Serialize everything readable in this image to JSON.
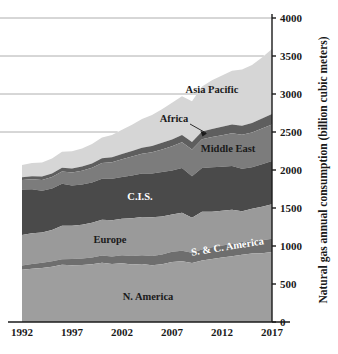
{
  "chart_data": {
    "type": "area",
    "title": "",
    "subtitle": "",
    "xlabel": "",
    "ylabel": "Natural gas annual consumption (billion cubic meters)",
    "xlim": [
      1992,
      2017
    ],
    "ylim": [
      0,
      4000
    ],
    "grid": true,
    "grid_values": [
      2500,
      3000,
      3500,
      4000
    ],
    "legend_position": "inline-labels",
    "y_axis_side": "right",
    "xticks": [
      "1992",
      "1997",
      "2002",
      "2007",
      "2012",
      "2017"
    ],
    "xtick_values": [
      1992,
      1997,
      2002,
      2007,
      2012,
      2017
    ],
    "yticks": [
      "0",
      "500",
      "1000",
      "1500",
      "2000",
      "2500",
      "3000",
      "3500",
      "4000"
    ],
    "ytick_values": [
      0,
      500,
      1000,
      1500,
      2000,
      2500,
      3000,
      3500,
      4000
    ],
    "x": [
      1992,
      1993,
      1994,
      1995,
      1996,
      1997,
      1998,
      1999,
      2000,
      2001,
      2002,
      2003,
      2004,
      2005,
      2006,
      2007,
      2008,
      2009,
      2010,
      2011,
      2012,
      2013,
      2014,
      2015,
      2016,
      2017
    ],
    "stack_order_bottom_to_top": [
      "N. America",
      "S. & C. America",
      "Europe",
      "C.I.S.",
      "Middle East",
      "Africa",
      "Asia Pacific"
    ],
    "series": [
      {
        "name": "N. America",
        "color": "#9e9e9e",
        "label_color": "#1a1a1a",
        "values": [
          687,
          700,
          712,
          728,
          752,
          748,
          750,
          760,
          780,
          762,
          772,
          758,
          762,
          748,
          760,
          790,
          800,
          775,
          810,
          830,
          850,
          865,
          885,
          900,
          905,
          920
        ]
      },
      {
        "name": "S. & C. America",
        "color": "#6e6e6e",
        "label_color": "#ffffff",
        "values": [
          58,
          62,
          66,
          70,
          74,
          80,
          85,
          90,
          96,
          100,
          105,
          110,
          116,
          122,
          128,
          134,
          138,
          136,
          145,
          152,
          158,
          162,
          168,
          170,
          172,
          175
        ]
      },
      {
        "name": "Europe",
        "color": "#9a9a9a",
        "label_color": "#1a1a1a",
        "values": [
          400,
          405,
          398,
          412,
          440,
          438,
          445,
          455,
          470,
          478,
          482,
          498,
          505,
          508,
          500,
          490,
          498,
          462,
          495,
          468,
          455,
          450,
          405,
          420,
          440,
          455
        ]
      },
      {
        "name": "C.I.S.",
        "color": "#4a4a4a",
        "label_color": "#ffffff",
        "values": [
          600,
          580,
          552,
          545,
          552,
          530,
          528,
          532,
          540,
          545,
          550,
          562,
          570,
          575,
          585,
          580,
          590,
          545,
          575,
          585,
          580,
          575,
          560,
          545,
          560,
          570
        ]
      },
      {
        "name": "Middle East",
        "color": "#7c7c7c",
        "label_color": "#1a1a1a",
        "values": [
          122,
          132,
          142,
          152,
          162,
          172,
          182,
          192,
          205,
          218,
          232,
          248,
          262,
          280,
          298,
          318,
          338,
          352,
          378,
          398,
          415,
          430,
          445,
          458,
          470,
          480
        ]
      },
      {
        "name": "Africa",
        "color": "#5e5e5e",
        "label_color": "#1a1a1a",
        "values": [
          38,
          40,
          43,
          46,
          49,
          52,
          55,
          58,
          62,
          66,
          70,
          75,
          78,
          82,
          86,
          90,
          95,
          98,
          102,
          108,
          112,
          116,
          120,
          126,
          132,
          138
        ]
      },
      {
        "name": "Asia Pacific",
        "color": "#d6d6d6",
        "label_color": "#1a1a1a",
        "values": [
          160,
          172,
          185,
          198,
          212,
          228,
          238,
          255,
          275,
          292,
          318,
          345,
          378,
          408,
          442,
          482,
          512,
          535,
          595,
          640,
          672,
          708,
          740,
          762,
          800,
          855
        ]
      }
    ],
    "annotations": [
      {
        "text": "Asia Pacific",
        "series": "Asia Pacific"
      },
      {
        "text": "Africa",
        "series": "Africa",
        "has_leader_arrow": true
      },
      {
        "text": "Middle East",
        "series": "Middle East"
      },
      {
        "text": "C.I.S.",
        "series": "C.I.S."
      },
      {
        "text": "Europe",
        "series": "Europe"
      },
      {
        "text": "S. & C. America",
        "series": "S. & C. America"
      },
      {
        "text": "N. America",
        "series": "N. America"
      }
    ]
  }
}
